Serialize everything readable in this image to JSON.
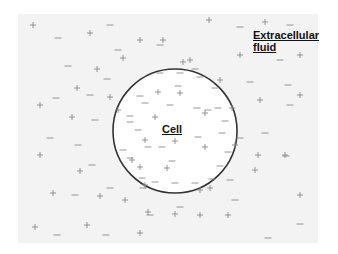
{
  "diagram": {
    "labels": {
      "cell": "Cell",
      "fluid_line1": "Extracellular",
      "fluid_line2": "fluid"
    },
    "cell": {
      "cx": 175,
      "cy": 131,
      "r": 62,
      "stroke": "#333333"
    },
    "colors": {
      "panel": "#f3f3f3",
      "charge": "#8a8a8a",
      "cell_fill": "#ffffff"
    },
    "outside_plus": [
      [
        33,
        25
      ],
      [
        90,
        33
      ],
      [
        140,
        40
      ],
      [
        123,
        58
      ],
      [
        97,
        69
      ],
      [
        163,
        40
      ],
      [
        77,
        88
      ],
      [
        40,
        105
      ],
      [
        72,
        117
      ],
      [
        110,
        97
      ],
      [
        118,
        110
      ],
      [
        209,
        20
      ],
      [
        265,
        22
      ],
      [
        183,
        62
      ],
      [
        190,
        60
      ],
      [
        240,
        55
      ],
      [
        300,
        55
      ],
      [
        220,
        80
      ],
      [
        260,
        100
      ],
      [
        300,
        95
      ],
      [
        232,
        108
      ],
      [
        235,
        145
      ],
      [
        258,
        155
      ],
      [
        285,
        155
      ],
      [
        300,
        195
      ],
      [
        255,
        170
      ],
      [
        210,
        188
      ],
      [
        175,
        214
      ],
      [
        200,
        215
      ],
      [
        228,
        215
      ],
      [
        40,
        155
      ],
      [
        53,
        193
      ],
      [
        80,
        171
      ],
      [
        100,
        196
      ],
      [
        35,
        227
      ],
      [
        87,
        225
      ],
      [
        140,
        233
      ],
      [
        125,
        200
      ],
      [
        148,
        212
      ],
      [
        132,
        160
      ],
      [
        145,
        185
      ]
    ],
    "outside_minus": [
      [
        110,
        25
      ],
      [
        58,
        38
      ],
      [
        160,
        45
      ],
      [
        240,
        27
      ],
      [
        290,
        25
      ],
      [
        118,
        50
      ],
      [
        68,
        66
      ],
      [
        195,
        69
      ],
      [
        107,
        79
      ],
      [
        56,
        98
      ],
      [
        90,
        95
      ],
      [
        95,
        120
      ],
      [
        280,
        60
      ],
      [
        250,
        82
      ],
      [
        288,
        85
      ],
      [
        208,
        110
      ],
      [
        50,
        138
      ],
      [
        78,
        145
      ],
      [
        92,
        165
      ],
      [
        110,
        188
      ],
      [
        75,
        195
      ],
      [
        265,
        133
      ],
      [
        286,
        156
      ],
      [
        230,
        180
      ],
      [
        235,
        200
      ],
      [
        300,
        224
      ],
      [
        268,
        238
      ],
      [
        57,
        235
      ],
      [
        106,
        235
      ],
      [
        150,
        215
      ],
      [
        180,
        207
      ],
      [
        130,
        122
      ],
      [
        140,
        96
      ],
      [
        290,
        105
      ],
      [
        240,
        138
      ]
    ],
    "inside_plus": [
      [
        158,
        92
      ],
      [
        180,
        93
      ],
      [
        155,
        117
      ],
      [
        205,
        113
      ],
      [
        145,
        140
      ],
      [
        175,
        141
      ],
      [
        205,
        147
      ],
      [
        167,
        168
      ],
      [
        200,
        190
      ],
      [
        140,
        167
      ]
    ],
    "inside_minus": [
      [
        160,
        73
      ],
      [
        180,
        73
      ],
      [
        200,
        77
      ],
      [
        178,
        86
      ],
      [
        215,
        88
      ],
      [
        145,
        103
      ],
      [
        170,
        105
      ],
      [
        197,
        108
      ],
      [
        218,
        108
      ],
      [
        130,
        116
      ],
      [
        225,
        121
      ],
      [
        138,
        130
      ],
      [
        222,
        133
      ],
      [
        148,
        147
      ],
      [
        162,
        147
      ],
      [
        198,
        137
      ],
      [
        123,
        150
      ],
      [
        130,
        158
      ],
      [
        228,
        152
      ],
      [
        220,
        166
      ],
      [
        142,
        178
      ],
      [
        172,
        161
      ],
      [
        212,
        179
      ],
      [
        155,
        182
      ],
      [
        175,
        183
      ],
      [
        195,
        183
      ],
      [
        143,
        188
      ]
    ]
  }
}
